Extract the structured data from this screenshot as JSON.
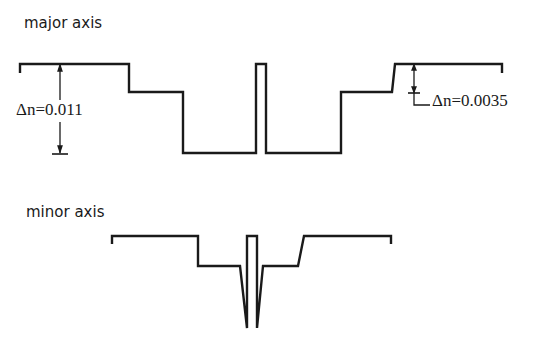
{
  "major": {
    "title": "major axis",
    "delta_left": "Δn=0.011",
    "delta_right": "Δn=0.0035",
    "profile": "20,73 20,64 129,64 129,92 183,92 183,153 256,153 256,64 266,64 266,153 341,153 341,92 392,92 395,64 502,64 502,73"
  },
  "minor": {
    "title": "minor axis",
    "profile": "112,244 112,236 198,236 198,266 240,266 247,328 247,236 257,236 257,328 263,266 298,266 304,236 391,236 391,244"
  },
  "colors": {
    "line": "#1a1a1a",
    "background": "#ffffff"
  }
}
